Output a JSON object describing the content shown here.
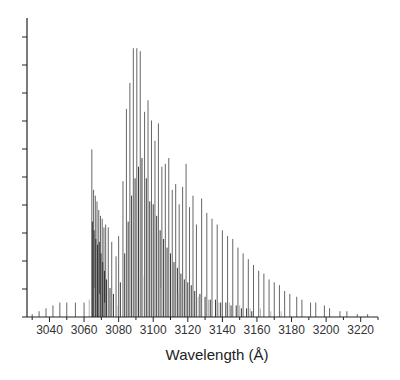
{
  "chart_data": {
    "type": "line",
    "subtype": "stick-spectrum",
    "title": "",
    "xlabel": "Wavelength (Å)",
    "ylabel": "",
    "xlim": [
      3027,
      3230
    ],
    "ylim": [
      0,
      1.0
    ],
    "x_ticks": [
      3040,
      3060,
      3080,
      3100,
      3120,
      3140,
      3160,
      3180,
      3200,
      3220
    ],
    "y_ticks_count": 10,
    "y_tick_labels_visible": false,
    "grid": false,
    "legend": null,
    "series": [
      {
        "name": "main-branch",
        "color": "#555555",
        "lines": [
          [
            3030,
            0.01
          ],
          [
            3034,
            0.02
          ],
          [
            3038,
            0.03
          ],
          [
            3042,
            0.04
          ],
          [
            3046,
            0.05
          ],
          [
            3050,
            0.05
          ],
          [
            3055,
            0.05
          ],
          [
            3060,
            0.05
          ],
          [
            3064.5,
            0.58
          ],
          [
            3065.5,
            0.44
          ],
          [
            3066.5,
            0.42
          ],
          [
            3067.5,
            0.4
          ],
          [
            3068.5,
            0.37
          ],
          [
            3069.5,
            0.35
          ],
          [
            3070.5,
            0.34
          ],
          [
            3071.5,
            0.31
          ],
          [
            3072.5,
            0.32
          ],
          [
            3074,
            0.31
          ],
          [
            3076,
            0.26
          ],
          [
            3078.5,
            0.21
          ],
          [
            3080,
            0.28
          ],
          [
            3082.5,
            0.47
          ],
          [
            3084.5,
            0.72
          ],
          [
            3086.5,
            0.81
          ],
          [
            3088.5,
            0.93
          ],
          [
            3090.5,
            0.93
          ],
          [
            3092.5,
            0.92
          ],
          [
            3095,
            0.71
          ],
          [
            3097,
            0.75
          ],
          [
            3099,
            0.68
          ],
          [
            3101,
            0.61
          ],
          [
            3103,
            0.67
          ],
          [
            3105,
            0.52
          ],
          [
            3107,
            0.53
          ],
          [
            3109,
            0.55
          ],
          [
            3111,
            0.44
          ],
          [
            3113,
            0.46
          ],
          [
            3115,
            0.39
          ],
          [
            3117,
            0.45
          ],
          [
            3119,
            0.53
          ],
          [
            3121,
            0.38
          ],
          [
            3123,
            0.42
          ],
          [
            3125,
            0.32
          ],
          [
            3128,
            0.41
          ],
          [
            3131,
            0.36
          ],
          [
            3134,
            0.34
          ],
          [
            3137,
            0.32
          ],
          [
            3140,
            0.3
          ],
          [
            3143,
            0.28
          ],
          [
            3146,
            0.27
          ],
          [
            3149,
            0.24
          ],
          [
            3152,
            0.22
          ],
          [
            3155,
            0.2
          ],
          [
            3158,
            0.18
          ],
          [
            3161,
            0.16
          ],
          [
            3164,
            0.15
          ],
          [
            3167,
            0.13
          ],
          [
            3170,
            0.12
          ],
          [
            3173,
            0.11
          ],
          [
            3176,
            0.09
          ],
          [
            3179,
            0.08
          ],
          [
            3183,
            0.07
          ],
          [
            3186,
            0.06
          ],
          [
            3191,
            0.05
          ],
          [
            3194,
            0.05
          ],
          [
            3199,
            0.04
          ],
          [
            3202,
            0.03
          ],
          [
            3208,
            0.02
          ],
          [
            3212,
            0.02
          ],
          [
            3218,
            0.01
          ],
          [
            3224,
            0.01
          ]
        ]
      },
      {
        "name": "secondary-branch",
        "color": "#222222",
        "lines": [
          [
            3064.8,
            0.33
          ],
          [
            3065.8,
            0.3
          ],
          [
            3066.8,
            0.27
          ],
          [
            3067.8,
            0.25
          ],
          [
            3068.8,
            0.26
          ],
          [
            3069.8,
            0.22
          ],
          [
            3070.8,
            0.19
          ],
          [
            3071.8,
            0.16
          ],
          [
            3073,
            0.13
          ],
          [
            3075,
            0.1
          ],
          [
            3077,
            0.08
          ],
          [
            3081,
            0.12
          ],
          [
            3083.5,
            0.22
          ],
          [
            3085.5,
            0.33
          ],
          [
            3087.5,
            0.42
          ],
          [
            3089.5,
            0.48
          ],
          [
            3091.5,
            0.52
          ],
          [
            3093.5,
            0.55
          ],
          [
            3096,
            0.48
          ],
          [
            3098,
            0.4
          ],
          [
            3100,
            0.39
          ],
          [
            3102,
            0.35
          ],
          [
            3104,
            0.3
          ],
          [
            3106,
            0.27
          ],
          [
            3108,
            0.24
          ],
          [
            3110,
            0.22
          ],
          [
            3112,
            0.19
          ],
          [
            3114,
            0.17
          ],
          [
            3116,
            0.15
          ],
          [
            3118,
            0.13
          ],
          [
            3120,
            0.12
          ],
          [
            3122,
            0.11
          ],
          [
            3124,
            0.09
          ],
          [
            3127,
            0.08
          ],
          [
            3130,
            0.07
          ],
          [
            3133,
            0.06
          ],
          [
            3136,
            0.06
          ],
          [
            3139,
            0.05
          ],
          [
            3142,
            0.05
          ],
          [
            3145,
            0.04
          ],
          [
            3148,
            0.04
          ],
          [
            3151,
            0.03
          ],
          [
            3154,
            0.03
          ],
          [
            3157,
            0.02
          ]
        ]
      },
      {
        "name": "weak-lines",
        "color": "#aaaaaa",
        "lines": [
          [
            3063,
            0.06
          ],
          [
            3066,
            0.1
          ],
          [
            3069,
            0.08
          ],
          [
            3072,
            0.05
          ],
          [
            3079,
            0.04
          ],
          [
            3094,
            0.14
          ],
          [
            3104.5,
            0.1
          ],
          [
            3114.5,
            0.08
          ],
          [
            3126,
            0.07
          ],
          [
            3132,
            0.06
          ],
          [
            3138,
            0.05
          ],
          [
            3144,
            0.05
          ],
          [
            3150,
            0.04
          ],
          [
            3156,
            0.03
          ],
          [
            3162,
            0.03
          ],
          [
            3168,
            0.02
          ],
          [
            3174,
            0.02
          ]
        ]
      }
    ]
  },
  "axis": {
    "x_title": "Wavelength (Å)",
    "x_tick_labels": [
      "3040",
      "3060",
      "3080",
      "3100",
      "3120",
      "3140",
      "3160",
      "3180",
      "3200",
      "3220"
    ]
  }
}
